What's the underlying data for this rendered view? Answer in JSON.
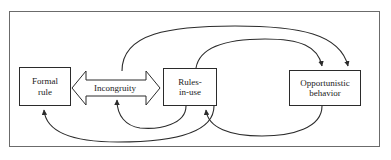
{
  "figure": {
    "frame_color": "#6b6b6b",
    "line_color": "#2b2b2b",
    "background": "#ffffff"
  },
  "nodes": [
    {
      "id": "formal-rule",
      "label": "Formal\nrule"
    },
    {
      "id": "rules-in-use",
      "label": "Rules-\nin-use"
    },
    {
      "id": "opportunistic-behavior",
      "label": "Opportunistic\nbehavior"
    }
  ],
  "connectors": [
    {
      "id": "incongruity-arrow",
      "label": "Incongruity",
      "style": "block-double-headed",
      "from": "formal-rule",
      "to": "rules-in-use"
    },
    {
      "id": "curve-incongruity-to-opportunistic",
      "style": "curved-arrow",
      "from": "incongruity",
      "to": "opportunistic-behavior"
    },
    {
      "id": "curve-rules-to-opportunistic",
      "style": "curved-arrow",
      "from": "rules-in-use",
      "to": "opportunistic-behavior"
    },
    {
      "id": "curve-opportunistic-to-rules",
      "style": "curved-arrow",
      "from": "opportunistic-behavior",
      "to": "rules-in-use"
    },
    {
      "id": "curve-rules-to-incongruity",
      "style": "curved-arrow",
      "from": "rules-in-use",
      "to": "incongruity"
    },
    {
      "id": "curve-rules-to-formal-rule",
      "style": "curved-arrow",
      "from": "rules-in-use",
      "to": "formal-rule"
    }
  ]
}
